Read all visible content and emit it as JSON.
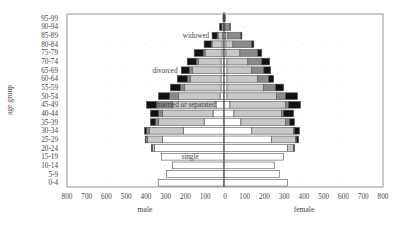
{
  "chart_data": {
    "type": "bar",
    "subtype": "population-pyramid-stacked",
    "title": "",
    "ylabel": "age group",
    "xlabel_left": "male",
    "xlabel_right": "female",
    "xlim": [
      -800,
      800
    ],
    "xticks": [
      800,
      700,
      600,
      500,
      400,
      300,
      200,
      100,
      0,
      100,
      200,
      300,
      400,
      500,
      600,
      700,
      800
    ],
    "grid": "dotted",
    "categories": [
      "0-4",
      "5-9",
      "10-14",
      "15-19",
      "20-24",
      "25-29",
      "30-34",
      "35-39",
      "40-44",
      "45-49",
      "50-54",
      "55-59",
      "60-64",
      "65-69",
      "70-74",
      "75-79",
      "80-84",
      "85-89",
      "90-94",
      "95-99"
    ],
    "series_order": [
      "single",
      "married or separated",
      "divorced",
      "widowed"
    ],
    "colors": {
      "single": "#ffffff",
      "married or separated": "#c8c8c8",
      "divorced": "#8a8a8a",
      "widowed": "#111111"
    },
    "annotations": [
      {
        "text": "widowed",
        "age_group": "85-89",
        "side": "male"
      },
      {
        "text": "divorced",
        "age_group": "65-69",
        "side": "male"
      },
      {
        "text": "married or separated",
        "age_group": "45-49",
        "side": "male"
      },
      {
        "text": "single",
        "age_group": "15-19",
        "side": "male"
      }
    ],
    "male": {
      "single": [
        331,
        290,
        260,
        315,
        350,
        310,
        205,
        100,
        55,
        40,
        20,
        15,
        15,
        15,
        15,
        10,
        10,
        8,
        3,
        1
      ],
      "married or separated": [
        0,
        0,
        0,
        0,
        10,
        75,
        170,
        230,
        255,
        220,
        210,
        185,
        155,
        145,
        115,
        85,
        50,
        22,
        7,
        2
      ],
      "divorced": [
        0,
        0,
        0,
        0,
        2,
        8,
        15,
        15,
        20,
        80,
        45,
        20,
        15,
        15,
        10,
        10,
        5,
        5,
        2,
        1
      ],
      "widowed": [
        0,
        0,
        0,
        0,
        3,
        2,
        10,
        25,
        40,
        50,
        55,
        50,
        50,
        40,
        45,
        45,
        35,
        25,
        10,
        1
      ]
    },
    "female": {
      "single": [
        320,
        280,
        255,
        300,
        320,
        240,
        140,
        85,
        50,
        30,
        15,
        15,
        15,
        15,
        15,
        10,
        10,
        8,
        3,
        1
      ],
      "married or separated": [
        0,
        0,
        0,
        0,
        30,
        120,
        210,
        225,
        240,
        280,
        250,
        185,
        155,
        125,
        105,
        70,
        35,
        12,
        2,
        1
      ],
      "divorced": [
        0,
        0,
        0,
        0,
        2,
        5,
        5,
        20,
        10,
        15,
        45,
        60,
        55,
        60,
        70,
        90,
        95,
        65,
        25,
        3
      ],
      "widowed": [
        0,
        0,
        0,
        0,
        3,
        10,
        25,
        25,
        50,
        60,
        60,
        40,
        25,
        35,
        40,
        20,
        10,
        5,
        2,
        1
      ]
    }
  },
  "labels": {
    "ylabel": "age group",
    "male": "male",
    "female": "female"
  }
}
